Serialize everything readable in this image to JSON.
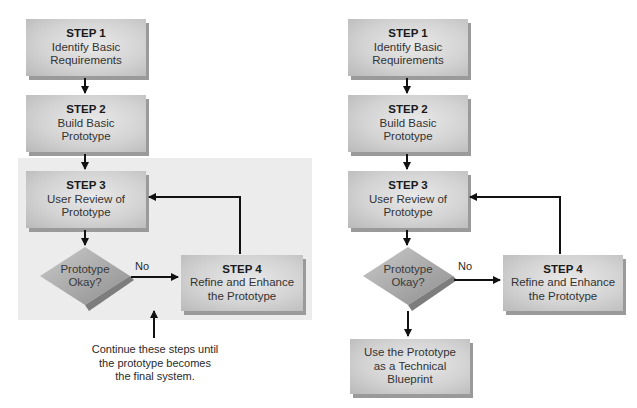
{
  "left_flow": {
    "step1": {
      "title": "STEP 1",
      "line1": "Identify Basic",
      "line2": "Requirements"
    },
    "step2": {
      "title": "STEP 2",
      "line1": "Build Basic",
      "line2": "Prototype"
    },
    "step3": {
      "title": "STEP 3",
      "line1": "User Review of",
      "line2": "Prototype"
    },
    "decision": {
      "line1": "Prototype",
      "line2": "Okay?"
    },
    "no_label": "No",
    "step4": {
      "title": "STEP 4",
      "line1": "Refine and Enhance",
      "line2": "the Prototype"
    },
    "caption": {
      "line1": "Continue these steps until",
      "line2": "the prototype becomes",
      "line3": "the final system."
    }
  },
  "right_flow": {
    "step1": {
      "title": "STEP 1",
      "line1": "Identify Basic",
      "line2": "Requirements"
    },
    "step2": {
      "title": "STEP 2",
      "line1": "Build Basic",
      "line2": "Prototype"
    },
    "step3": {
      "title": "STEP 3",
      "line1": "User Review of",
      "line2": "Prototype"
    },
    "decision": {
      "line1": "Prototype",
      "line2": "Okay?"
    },
    "no_label": "No",
    "step4": {
      "title": "STEP 4",
      "line1": "Refine and Enhance",
      "line2": "the Prototype"
    },
    "final": {
      "line1": "Use the Prototype",
      "line2": "as a Technical",
      "line3": "Blueprint"
    }
  },
  "colors": {
    "panel_bg": "#ececec",
    "box_light": "#e9e9e9",
    "box_dark": "#b9b9b9",
    "box_shadow": "#9a9a9a",
    "diamond_light": "#c9c9c9",
    "diamond_dark": "#8f8f8f",
    "arrow": "#111111"
  }
}
